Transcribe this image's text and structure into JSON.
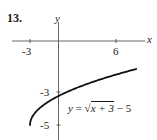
{
  "problem_number": "13.",
  "axes": {
    "x_label": "x",
    "y_label": "y",
    "x_ticks": [
      "-3",
      "6"
    ],
    "y_ticks": [
      "-3",
      "-5"
    ]
  },
  "equation": {
    "lhs": "y",
    "equals": "=",
    "radical_sign": "√",
    "radicand": "x + 3",
    "tail": " − 5"
  },
  "chart_data": {
    "type": "line",
    "title": "13.",
    "function": "y = sqrt(x + 3) - 5",
    "xlabel": "x",
    "ylabel": "y",
    "x_tick_labels": [
      -3,
      6
    ],
    "y_tick_labels": [
      -3,
      -5
    ],
    "xlim": [
      -6,
      9.5
    ],
    "ylim": [
      -5.8,
      2.4
    ],
    "grid": false,
    "legend": null,
    "annotations": [
      "y = √(x + 3) − 5"
    ],
    "series": [
      {
        "name": "y = √(x + 3) − 5",
        "x": [
          -3,
          -2.75,
          -2,
          -1,
          0,
          1,
          2,
          3,
          4,
          5,
          6,
          7,
          8
        ],
        "y": [
          -5,
          -4.5,
          -4,
          -3.59,
          -3.27,
          -3,
          -2.76,
          -2.55,
          -2.35,
          -2.17,
          -2,
          -1.84,
          -1.68
        ]
      }
    ],
    "colors": {
      "curve": "#111111",
      "axes": "#555555"
    }
  }
}
